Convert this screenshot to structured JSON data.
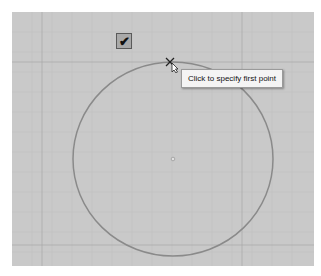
{
  "canvas": {
    "background": "#c9c9c9",
    "grid_color": "#b5b5b5",
    "major_grid_color": "#9d9d9d"
  },
  "toolbar": {
    "confirm_button": {
      "icon": "checkmark-icon",
      "glyph": "✔"
    }
  },
  "drawing": {
    "circle": {
      "cx": 161,
      "cy": 147,
      "rx": 100,
      "ry": 97,
      "stroke": "#8a8a8a"
    },
    "center_marker": {
      "x": 161,
      "y": 147
    }
  },
  "cursor": {
    "icon": "crosshair-cursor-icon"
  },
  "tooltip": {
    "text": "Click to specify first point"
  }
}
